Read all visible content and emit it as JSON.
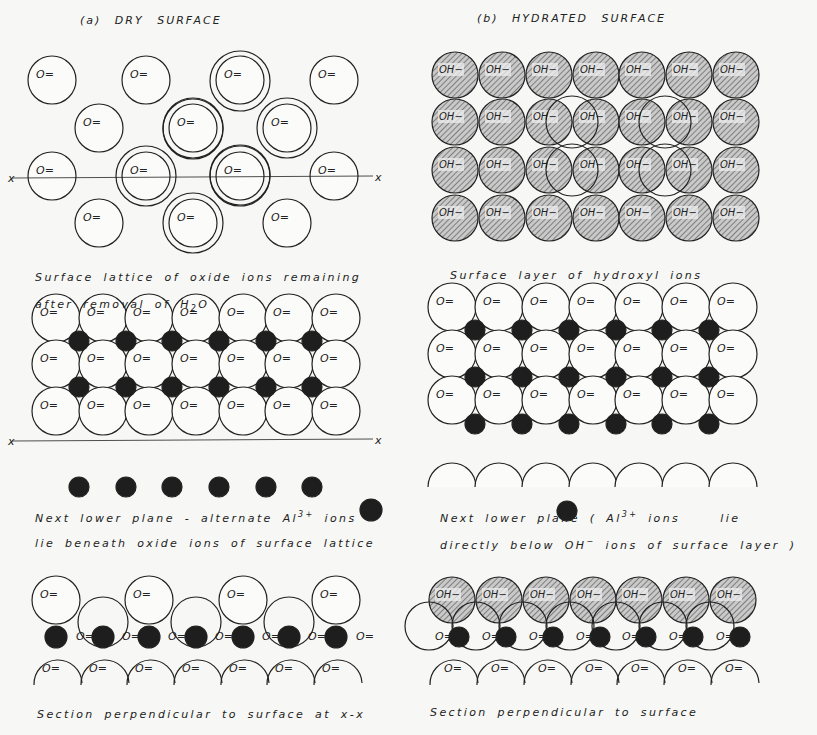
{
  "figure": {
    "panel_a": {
      "title": "(a)  DRY  SURFACE",
      "caption_1_line1": "Surface lattice of oxide ions remaining",
      "caption_1_line2_pre": "after removal of H",
      "caption_1_line2_sub": "2",
      "caption_1_line2_post": "O",
      "caption_2_line1_pre": "Next lower plane - alternate Al",
      "caption_2_line1_sup": "3+",
      "caption_2_line1_post": " ions",
      "caption_2_line2": "lie beneath oxide ions of surface lattice",
      "caption_3": "Section perpendicular to surface at x-x",
      "axis_label": "x",
      "ion_label": "O=",
      "surface_ion_count": 14,
      "lattice_rows": 3,
      "lattice_cols": 7
    },
    "panel_b": {
      "title": "(b)  HYDRATED  SURFACE",
      "caption_1": "Surface layer of hydroxyl ions",
      "caption_2_line1_pre": "Next lower plane ( Al",
      "caption_2_line1_sup": "3+",
      "caption_2_line1_post": " ions",
      "caption_2_line1_end": "lie",
      "caption_2_line2_pre": "directly below OH",
      "caption_2_line2_sup": "−",
      "caption_2_line2_post": " ions of surface layer )",
      "caption_3": "Section perpendicular to surface",
      "hydroxyl_label": "OH−",
      "ion_label": "O=",
      "hydroxyl_rows": 4,
      "hydroxyl_cols": 7,
      "lattice_rows": 3,
      "lattice_cols": 7
    },
    "colors": {
      "ink": "#222222",
      "al_ion": "#1e1e1e",
      "hatch_fill": "#b8b8b8",
      "background": "#f7f7f5"
    }
  }
}
